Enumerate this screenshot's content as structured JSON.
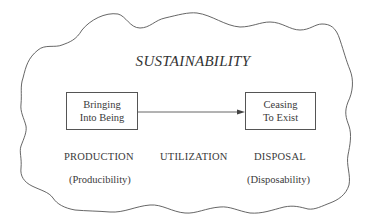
{
  "diagram": {
    "title": "SUSTAINABILITY",
    "boxes": [
      {
        "id": "start",
        "lines": [
          "Bringing",
          "Into Being"
        ]
      },
      {
        "id": "end",
        "lines": [
          "Ceasing",
          "To Exist"
        ]
      }
    ],
    "arrow": {
      "from": "start",
      "to": "end"
    },
    "phases": [
      {
        "label": "PRODUCTION",
        "sublabel": "(Producibility)"
      },
      {
        "label": "UTILIZATION",
        "sublabel": ""
      },
      {
        "label": "DISPOSAL",
        "sublabel": "(Disposability)"
      }
    ],
    "colors": {
      "stroke": "#555555",
      "text": "#3a3a3a",
      "background": "#ffffff"
    }
  }
}
